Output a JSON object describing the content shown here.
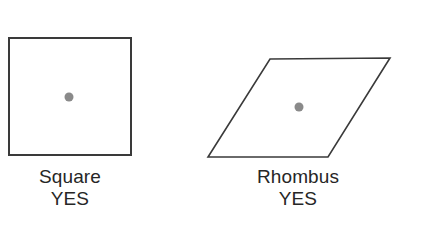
{
  "figure": {
    "background_color": "#ffffff",
    "stroke_color": "#3a3a3a",
    "dot_color": "#8a8a8a",
    "text_color": "#262626",
    "items": [
      {
        "id": "square",
        "shape_kind": "square",
        "name_label": "Square",
        "answer_label": "YES",
        "outline_points": "9,38 131,38 131,155 9,155",
        "center_dot": {
          "cx": 69,
          "cy": 97,
          "r": 4.5
        }
      },
      {
        "id": "rhombus",
        "shape_kind": "rhombus",
        "name_label": "Rhombus",
        "answer_label": "YES",
        "outline_points": "270,59 390,58 328,157 208,157",
        "center_dot": {
          "cx": 299,
          "cy": 107,
          "r": 4.5
        }
      }
    ]
  }
}
